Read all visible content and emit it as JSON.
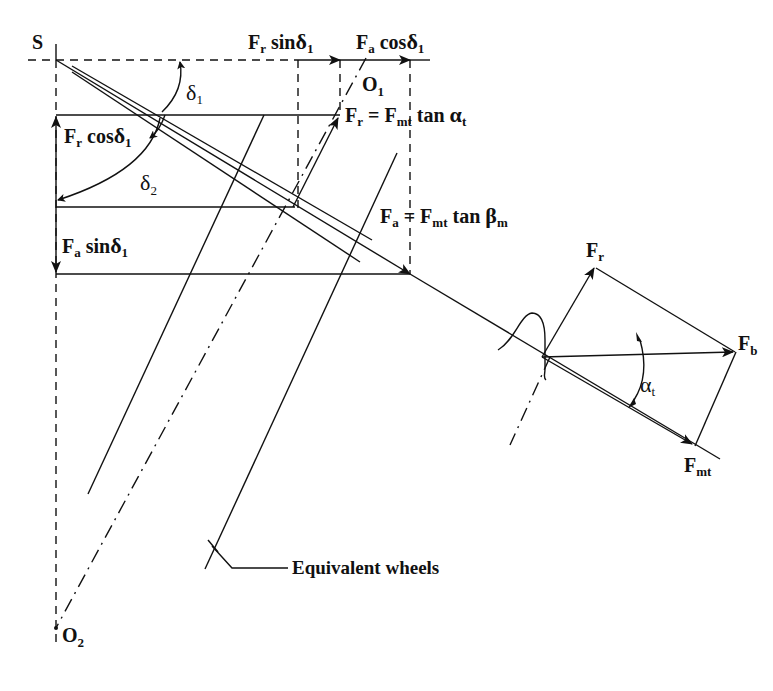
{
  "figure": {
    "labels": {
      "S": "S",
      "O1": "O",
      "O1_sub": "1",
      "O2": "O",
      "O2_sub": "2",
      "delta1": "δ",
      "delta1_sub": "1",
      "delta2": "δ",
      "delta2_sub": "2",
      "fr_sin": {
        "f": "F",
        "fsub": "r",
        "rest": " sin",
        "g": "δ",
        "gsub": "1"
      },
      "fa_cos": {
        "f": "F",
        "fsub": "a",
        "rest": " cos",
        "g": "δ",
        "gsub": "1"
      },
      "fr_cos": {
        "f": "F",
        "fsub": "r",
        "rest": " cos",
        "g": "δ",
        "gsub": "1"
      },
      "fa_sin": {
        "f": "F",
        "fsub": "a",
        "rest": " sin",
        "g": "δ",
        "gsub": "1"
      },
      "fr_eq": {
        "f": "F",
        "fsub": "r",
        "eq": " = F",
        "msub": "mt",
        "rest": " tan ",
        "g": "α",
        "gsub": "t"
      },
      "fa_eq": {
        "f": "F",
        "fsub": "a",
        "eq": " = F",
        "msub": "mt",
        "rest": " tan ",
        "g": "β",
        "gsub": "m"
      },
      "triangle_fr": {
        "f": "F",
        "fsub": "r"
      },
      "triangle_fb": {
        "f": "F",
        "fsub": "b"
      },
      "triangle_fmt": {
        "f": "F",
        "fsub": "mt"
      },
      "alpha_t": {
        "g": "α",
        "gsub": "t"
      },
      "equivalent_wheels": "Equivalent wheels"
    }
  }
}
